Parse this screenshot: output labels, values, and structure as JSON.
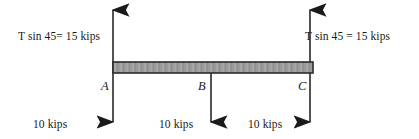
{
  "figure": {
    "type": "free-body-diagram",
    "colors": {
      "background": "#ffffff",
      "ink": "#1a1a1a",
      "beam_fill": "#9a9a9a",
      "beam_stroke": "#2b2b2b"
    },
    "beam": {
      "left_x": 113,
      "right_x": 313,
      "top_y": 62,
      "bottom_y": 73
    },
    "tension_forces": [
      {
        "id": "tension-left",
        "label": "T sin 45= 15 kips",
        "direction": "up",
        "at_point": "A",
        "magnitude": 15,
        "unit": "kips"
      },
      {
        "id": "tension-right",
        "label": "T sin 45 = 15 kips",
        "direction": "up",
        "at_point": "C",
        "magnitude": 15,
        "unit": "kips"
      }
    ],
    "applied_loads": [
      {
        "id": "load-a",
        "label": "10 kips",
        "direction": "down",
        "at_point": "A",
        "magnitude": 10,
        "unit": "kips"
      },
      {
        "id": "load-b",
        "label": "10 kips",
        "direction": "down",
        "at_point": "B",
        "magnitude": 10,
        "unit": "kips"
      },
      {
        "id": "load-c",
        "label": "10 kips",
        "direction": "down",
        "at_point": "C",
        "magnitude": 10,
        "unit": "kips"
      }
    ],
    "points": [
      {
        "id": "point-a",
        "label": "A",
        "x": 113
      },
      {
        "id": "point-b",
        "label": "B",
        "x": 211
      },
      {
        "id": "point-c",
        "label": "C",
        "x": 310
      }
    ]
  }
}
